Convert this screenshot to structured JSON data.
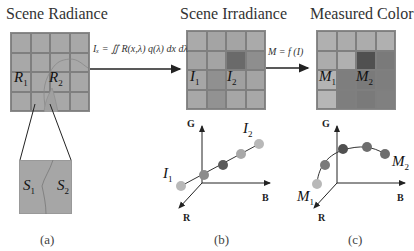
{
  "panels": {
    "a": {
      "title": "Scene Radiance",
      "caption": "(a)",
      "labels": {
        "r1": "R",
        "r1_sub": "1",
        "r2": "R",
        "r2_sub": "2",
        "s1": "S",
        "s1_sub": "1",
        "s2": "S",
        "s2_sub": "2"
      }
    },
    "b": {
      "title": "Scene Irradiance",
      "caption": "(b)",
      "labels": {
        "i1": "I",
        "i1_sub": "1",
        "i2": "I",
        "i2_sub": "2",
        "plot_i1": "I",
        "plot_i1_sub": "1",
        "plot_i2": "I",
        "plot_i2_sub": "2"
      },
      "axes": {
        "g": "G",
        "b": "B",
        "r": "R"
      }
    },
    "c": {
      "title": "Measured Color",
      "caption": "(c)",
      "labels": {
        "m1": "M",
        "m1_sub": "1",
        "m2": "M",
        "m2_sub": "2",
        "plot_m1": "M",
        "plot_m1_sub": "1",
        "plot_m2": "M",
        "plot_m2_sub": "2"
      },
      "axes": {
        "g": "G",
        "b": "B",
        "r": "R"
      }
    }
  },
  "arrows": {
    "a_to_b": {
      "formula": "Iₓ = ∬ R(x,λ) q(λ) dx dλ"
    },
    "b_to_c": {
      "formula": "M = f (I)"
    }
  },
  "colors": {
    "radiance_cell": "#a8a8a8",
    "irr_light": "#aaaaaa",
    "irr_mid": "#9a9a9a",
    "irr_dark": "#6a6a6a",
    "meas_light": "#b0b0b0",
    "meas_mid": "#7e7e7e",
    "meas_dark": "#505050",
    "point_light": "#b8b8b8",
    "point_mid": "#8c8c8c",
    "point_dark": "#5a5a5a"
  }
}
